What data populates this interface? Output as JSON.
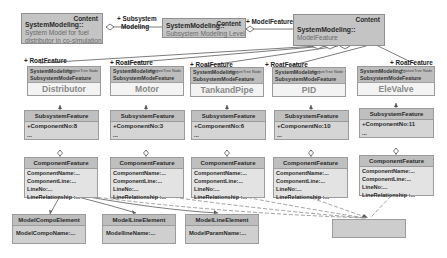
{
  "top": {
    "system": {
      "stereotype": "Content",
      "title": "SystemModeling::",
      "desc_lines": [
        "System Model for fuel",
        "distributor in co-simulation"
      ]
    },
    "subsystem": {
      "stereotype": "Content",
      "title": "SystemModeling::",
      "desc": "Subsystem Modeling Level"
    },
    "model": {
      "stereotype": "Content",
      "title": "SystemModeling::",
      "desc": "ModelFeature"
    },
    "link_subsystem_label_lines": [
      "+ Subsystem",
      "Modeling"
    ],
    "link_model_label": "+ ModelFeature"
  },
  "root_label": "+ RoatFeature",
  "features": [
    {
      "name": "Distributor",
      "hdr1": "SystemModeling::",
      "hdr1s": "FeatureTree Node",
      "hdr2": "SubsystemModeFeature",
      "component_no": "+ComponentNo:8",
      "more": "..."
    },
    {
      "name": "Motor",
      "hdr1": "SystemModeling::",
      "hdr1s": "FeatureTree Node",
      "hdr2": "SubsystemModeFeature",
      "component_no": "+ComponentNo:3",
      "more": "..."
    },
    {
      "name": "TankandPipe",
      "hdr1": "SystemModeling::",
      "hdr1s": "FeatureTree Node",
      "hdr2": "SubsystemModeFeature",
      "component_no": "+ComponentNo:6",
      "more": "..."
    },
    {
      "name": "PID",
      "hdr1": "SystemModeling::",
      "hdr1s": "FeatureTree Node",
      "hdr2": "SubsystemModeFeature",
      "component_no": "+ComponentNo:10",
      "more": "..."
    },
    {
      "name": "EleValve",
      "hdr1": "SystemModeling::",
      "hdr1s": "FeatureTree Node",
      "hdr2": "SubsystemModeFeature",
      "component_no": "+ComponentNo:11",
      "more": "..."
    }
  ],
  "subsystem_header": "SubsystemFeature",
  "component": {
    "header": "ComponentFeature",
    "rows": [
      "ComponentName:...",
      "ComponentLine:...",
      "LineNo:...",
      "LineRelationship :..."
    ]
  },
  "models": [
    {
      "header": "ModelCompoElement",
      "row": "ModelCompoName:..."
    },
    {
      "header": "ModelLineElement",
      "row": "ModellineName:..."
    },
    {
      "header": "ModelLineElement",
      "row": "ModelParamName:..."
    }
  ],
  "colors": {
    "box_fill": "#c4c4c4",
    "header_fill": "#bdbdbd",
    "line": "#666666",
    "dashed": "#8a8a8a"
  }
}
